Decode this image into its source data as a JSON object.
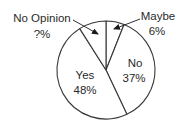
{
  "chart_data": {
    "type": "pie",
    "title": "",
    "start": "top",
    "direction": "clockwise",
    "slices": [
      {
        "name": "Maybe",
        "value": 6,
        "label": "Maybe",
        "value_label": "6%",
        "callout": true
      },
      {
        "name": "No",
        "value": 37,
        "label": "No",
        "value_label": "37%",
        "callout": false
      },
      {
        "name": "Yes",
        "value": 48,
        "label": "Yes",
        "value_label": "48%",
        "callout": false
      },
      {
        "name": "No Opinion",
        "value": 9,
        "label": "No Opinion",
        "value_label": "?%",
        "callout": true
      }
    ],
    "colors": {
      "fill": "#ffffff",
      "stroke": "#3a3a3a",
      "text": "#2a2a2a"
    },
    "legend": "none"
  }
}
